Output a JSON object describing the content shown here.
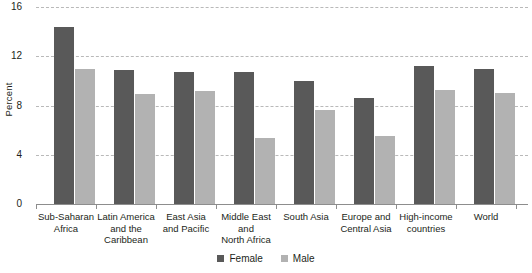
{
  "chart_data": {
    "type": "bar",
    "title": "",
    "subtitle": "",
    "xlabel": "",
    "ylabel": "Percent",
    "ylim": [
      0,
      16
    ],
    "yticks": [
      0,
      4,
      8,
      12,
      16
    ],
    "ytick_labels": [
      "0",
      "4",
      "8",
      "12",
      "16"
    ],
    "grid": true,
    "grid_style": "horizontal-dashed",
    "legend_position": "bottom-center",
    "categories": [
      "Sub-Saharan Africa",
      "Latin America and the Caribbean",
      "East Asia and Pacific",
      "Middle East and North Africa",
      "South Asia",
      "Europe and Central Asia",
      "High-income countries",
      "World"
    ],
    "category_lines": [
      [
        "Sub-Saharan",
        "Africa"
      ],
      [
        "Latin America",
        "and the",
        "Caribbean"
      ],
      [
        "East Asia",
        "and Pacific"
      ],
      [
        "Middle East",
        "and",
        "North Africa"
      ],
      [
        "South Asia"
      ],
      [
        "Europe and",
        "Central Asia"
      ],
      [
        "High-income",
        "countries"
      ],
      [
        "World"
      ]
    ],
    "series": [
      {
        "name": "Female",
        "color": "#595959",
        "values": [
          14.4,
          10.9,
          10.7,
          10.7,
          10.0,
          8.6,
          11.2,
          11.0
        ]
      },
      {
        "name": "Male",
        "color": "#b2b2b2",
        "values": [
          11.0,
          8.9,
          9.2,
          5.4,
          7.6,
          5.5,
          9.3,
          9.0
        ]
      }
    ]
  },
  "legend": {
    "items": [
      {
        "label": "Female",
        "color": "#595959"
      },
      {
        "label": "Male",
        "color": "#b2b2b2"
      }
    ]
  },
  "colors": {
    "female": "#595959",
    "male": "#b2b2b2",
    "gridline": "#b9b9b9",
    "axis": "#8d8d8d",
    "text": "#231f20",
    "background": "#ffffff"
  }
}
